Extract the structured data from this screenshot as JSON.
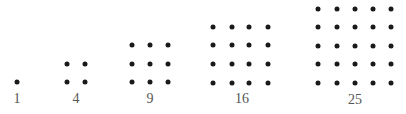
{
  "colors": {
    "dot": "#1a1a1a",
    "label": "#555555",
    "background": "#ffffff"
  },
  "figures": [
    {
      "label": "1",
      "n": 1,
      "xs": [
        17
      ],
      "ys": [
        82
      ],
      "label_x": 17,
      "label_y": 99
    },
    {
      "label": "4",
      "n": 2,
      "xs": [
        67,
        85
      ],
      "ys": [
        64,
        82
      ],
      "label_x": 76,
      "label_y": 99
    },
    {
      "label": "9",
      "n": 3,
      "xs": [
        132,
        150,
        168
      ],
      "ys": [
        45,
        64,
        82
      ],
      "label_x": 150,
      "label_y": 99
    },
    {
      "label": "16",
      "n": 4,
      "xs": [
        213,
        232,
        249,
        268
      ],
      "ys": [
        27,
        45,
        64,
        83
      ],
      "label_x": 242,
      "label_y": 99
    },
    {
      "label": "25",
      "n": 5,
      "xs": [
        318,
        337,
        355,
        373,
        391
      ],
      "ys": [
        9,
        27,
        46,
        64,
        83
      ],
      "label_x": 355,
      "label_y": 100
    }
  ]
}
